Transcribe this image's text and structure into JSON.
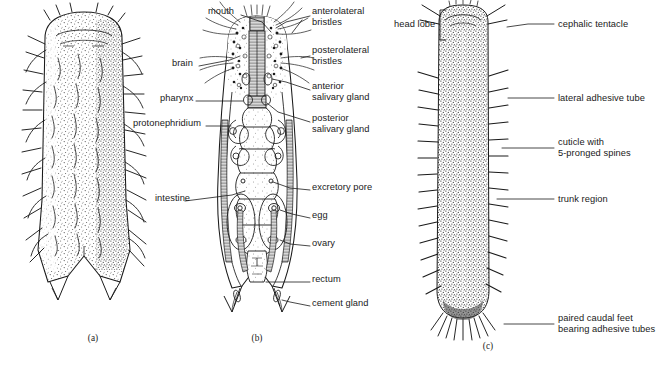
{
  "figure": {
    "type": "scientific-illustration",
    "background_color": "#ffffff",
    "ink_color": "#1a1a1a"
  },
  "panels": [
    {
      "id": "a",
      "caption": "(a)",
      "caption_x": 93,
      "caption_y": 339
    },
    {
      "id": "b",
      "caption": "(b)",
      "caption_y": 339,
      "caption_x": 257
    },
    {
      "id": "c",
      "caption": "(c)",
      "caption_x": 488,
      "caption_y": 347
    }
  ],
  "labels": [
    {
      "name": "mouth",
      "text": "mouth",
      "x": 208,
      "y": 11,
      "align": "left"
    },
    {
      "name": "anterolateral-bristles",
      "text": "anterolateral\nbristles",
      "x": 312,
      "y": 11,
      "align": "left"
    },
    {
      "name": "posterolateral-bristles",
      "text": "posterolateral\nbristles",
      "x": 312,
      "y": 50,
      "align": "left"
    },
    {
      "name": "brain",
      "text": "brain",
      "x": 172,
      "y": 63,
      "align": "left"
    },
    {
      "name": "anterior-salivary-gland",
      "text": "anterior\nsalivary gland",
      "x": 312,
      "y": 86,
      "align": "left"
    },
    {
      "name": "pharynx",
      "text": "pharynx",
      "x": 160,
      "y": 98,
      "align": "left"
    },
    {
      "name": "posterior-salivary-gland",
      "text": "posterior\nsalivary gland",
      "x": 312,
      "y": 118,
      "align": "left"
    },
    {
      "name": "protonephridium",
      "text": "protonephridium",
      "x": 133,
      "y": 123,
      "align": "left"
    },
    {
      "name": "excretory-pore",
      "text": "excretory pore",
      "x": 312,
      "y": 187,
      "align": "left"
    },
    {
      "name": "intestine",
      "text": "intestine",
      "x": 155,
      "y": 198,
      "align": "left"
    },
    {
      "name": "egg",
      "text": "egg",
      "x": 312,
      "y": 215,
      "align": "left"
    },
    {
      "name": "ovary",
      "text": "ovary",
      "x": 312,
      "y": 243,
      "align": "left"
    },
    {
      "name": "rectum",
      "text": "rectum",
      "x": 312,
      "y": 279,
      "align": "left"
    },
    {
      "name": "cement-gland",
      "text": "cement gland",
      "x": 312,
      "y": 303,
      "align": "left"
    },
    {
      "name": "head-lobe",
      "text": "head lobe",
      "x": 394,
      "y": 12,
      "align": "left"
    },
    {
      "name": "cephalic-tentacle",
      "text": "cephalic tentacle",
      "x": 556,
      "y": 21,
      "align": "left"
    },
    {
      "name": "lateral-adhesive-tube",
      "text": "lateral adhesive tube",
      "x": 556,
      "y": 95,
      "align": "left"
    },
    {
      "name": "cuticle-with-spines",
      "text": "cuticle with\n5-pronged spines",
      "x": 556,
      "y": 144,
      "align": "left"
    },
    {
      "name": "trunk-region",
      "text": "trunk region",
      "x": 556,
      "y": 196,
      "align": "left"
    },
    {
      "name": "paired-caudal-feet",
      "text": "paired caudal feet\nbearing adhesive tubes",
      "x": 556,
      "y": 320,
      "align": "left"
    }
  ],
  "leader_lines": [
    {
      "name": "leader-mouth",
      "points": "241,15 262,22 271,32"
    },
    {
      "name": "leader-anterolateral-bristles",
      "points": "310,16 286,22 276,28"
    },
    {
      "name": "leader-anterolateral-bristles-2",
      "points": "310,16 292,33"
    },
    {
      "name": "leader-posterolateral-bristles",
      "points": "310,56 300,58"
    },
    {
      "name": "leader-brain",
      "points": "199,66 230,60 240,56"
    },
    {
      "name": "leader-anterior-salivary",
      "points": "310,90 286,82 274,78"
    },
    {
      "name": "leader-pharynx",
      "points": "196,101 243,101"
    },
    {
      "name": "leader-posterior-salivary",
      "points": "310,122 278,112 266,104"
    },
    {
      "name": "leader-protonephridium",
      "points": "206,126 231,126"
    },
    {
      "name": "leader-excretory-pore",
      "points": "310,190 288,190 272,182"
    },
    {
      "name": "leader-intestine",
      "points": "185,201 232,195 244,190"
    },
    {
      "name": "leader-egg",
      "points": "310,218 290,214"
    },
    {
      "name": "leader-ovary",
      "points": "310,246 288,244"
    },
    {
      "name": "leader-rectum",
      "points": "310,282 262,282"
    },
    {
      "name": "leader-cement-gland",
      "points": "310,306 288,302"
    },
    {
      "name": "leader-cephalic-tentacle",
      "points": "554,24 528,24 508,28"
    },
    {
      "name": "leader-lateral-adhesive-tube",
      "points": "554,98 508,98"
    },
    {
      "name": "leader-cuticle-spines",
      "points": "554,148 501,148"
    },
    {
      "name": "leader-trunk-region",
      "points": "554,199 496,199"
    },
    {
      "name": "leader-paired-caudal-feet",
      "points": "554,324 504,324"
    }
  ],
  "bracket": {
    "name": "head-lobe-bracket",
    "x": 440,
    "y_top": 10,
    "y_bottom": 40,
    "width": 6
  }
}
